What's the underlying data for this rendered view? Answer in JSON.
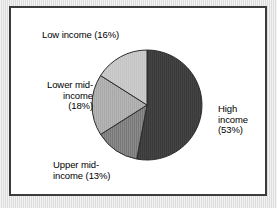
{
  "figure": {
    "panel_background": "#ffffff",
    "panel_border_color": "#3c3c3c",
    "page_background": "#e9e9e9"
  },
  "chart_data": {
    "type": "pie",
    "title": "",
    "subtitle": "",
    "xlabel": "",
    "ylabel": "",
    "legend_position": "none",
    "grid": false,
    "units": "percent",
    "total": 100,
    "categories": [
      "High income",
      "Upper mid-income",
      "Lower mid-income",
      "Low income"
    ],
    "values": [
      53,
      13,
      18,
      16
    ],
    "labels": [
      "High\nincome\n(53%)",
      "Upper mid-\nincome (13%)",
      "Lower mid-\nincome\n(18%)",
      "Low income (16%)"
    ],
    "slices": [
      {
        "name": "High income",
        "value": 53,
        "label": "High\nincome\n(53%)",
        "color": "#3a3a3a",
        "start_angle": 0,
        "end_angle": 190.8
      },
      {
        "name": "Upper mid-income",
        "value": 13,
        "label": "Upper mid-\nincome (13%)",
        "color": "#787878",
        "start_angle": 190.8,
        "end_angle": 237.6
      },
      {
        "name": "Lower mid-income",
        "value": 18,
        "label": "Lower mid-\nincome\n(18%)",
        "color": "#a9a9a9",
        "start_angle": 237.6,
        "end_angle": 302.4
      },
      {
        "name": "Low income",
        "value": 16,
        "label": "Low income (16%)",
        "color": "#c4c4c4",
        "start_angle": 302.4,
        "end_angle": 360
      }
    ]
  }
}
